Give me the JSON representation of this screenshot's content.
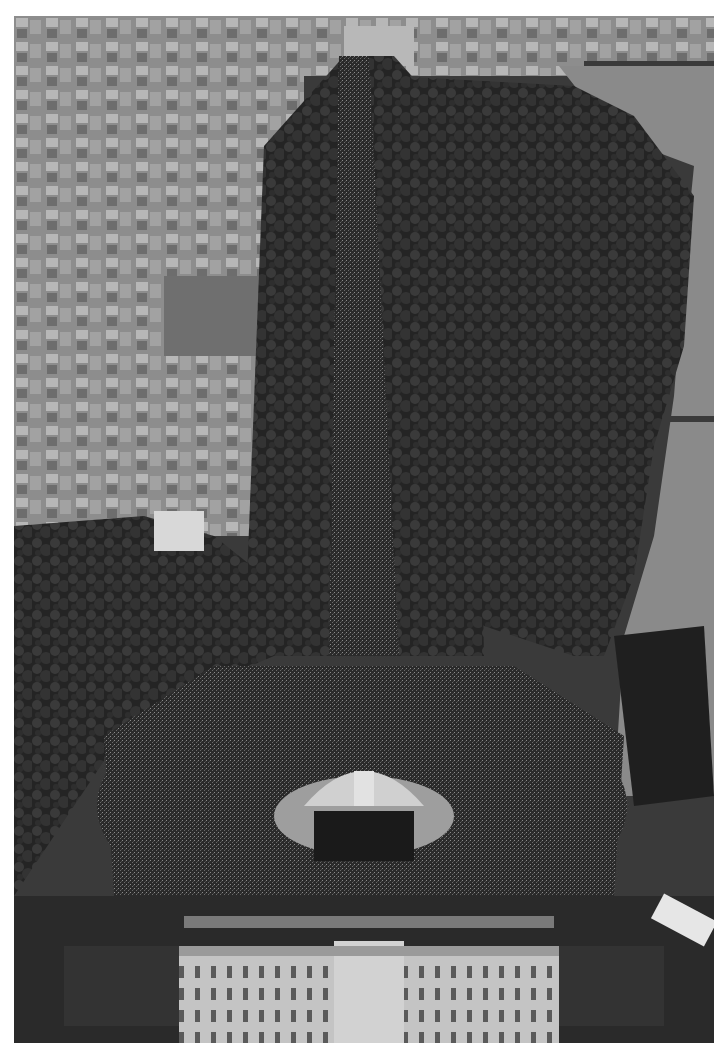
{
  "image": {
    "kind": "aerial-photograph",
    "color_mode": "grayscale",
    "subject": "Aerial view of The Mall with a large crowd leading to a stage in front of a palace",
    "frame": {
      "left": 14,
      "top": 16,
      "width": 700,
      "height": 1027,
      "border_color": "#ffffff"
    },
    "regions": [
      {
        "name": "city-buildings-top-left",
        "tone": "#9a9a9a"
      },
      {
        "name": "building-arch-top-center",
        "tone": "#b5b5b5"
      },
      {
        "name": "tree-lined-avenue",
        "tone": "#2c2c2c"
      },
      {
        "name": "crowd-on-avenue",
        "tone": "#4a4a4a"
      },
      {
        "name": "park-trees-right",
        "tone": "#333333"
      },
      {
        "name": "lake-right",
        "tone": "#8c8c8c"
      },
      {
        "name": "crowd-circle",
        "tone": "#3a3a3a"
      },
      {
        "name": "memorial-stage",
        "tone": "#c8c8c8"
      },
      {
        "name": "palace-facade-bottom",
        "tone": "#bdbdbd"
      },
      {
        "name": "forecourt-left",
        "tone": "#2e2e2e"
      },
      {
        "name": "forecourt-right",
        "tone": "#2e2e2e"
      }
    ]
  }
}
